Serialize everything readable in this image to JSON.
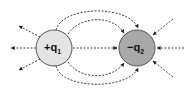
{
  "diagram": {
    "charges": [
      {
        "id": "q1",
        "sign": "+",
        "label": "+q",
        "subscript": "1",
        "fill": "#e4e4e4"
      },
      {
        "id": "q2",
        "sign": "-",
        "label": "−q",
        "subscript": "2",
        "fill": "#a9a9a9"
      }
    ],
    "line_style": "dashed",
    "line_color": "#333333"
  }
}
